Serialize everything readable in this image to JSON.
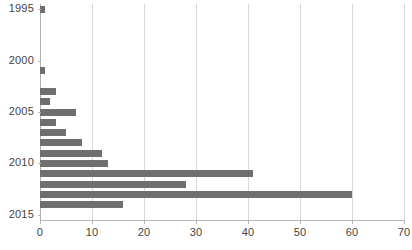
{
  "chart_data": {
    "type": "bar",
    "orientation": "horizontal",
    "title": "",
    "subtitle": "",
    "xlabel": "",
    "ylabel": "",
    "xlim": [
      0,
      70
    ],
    "ylim_categories": [
      "1995",
      "2015"
    ],
    "grid": true,
    "legend": null,
    "legend_position": "none",
    "bar_color": "#6f6f6f",
    "gridline_color": "#d9d9d9",
    "axis_color": "#b9b9b9",
    "text_color": "#444444",
    "xticks": [
      0,
      10,
      20,
      30,
      40,
      50,
      60,
      70
    ],
    "xtick_labels": [
      "0",
      "10",
      "20",
      "30",
      "40",
      "50",
      "60",
      "70"
    ],
    "yticks": [
      1995,
      2000,
      2005,
      2010,
      2015
    ],
    "ytick_labels": [
      "1995",
      "2000",
      "2005",
      "2010",
      "2015"
    ],
    "categories": [
      "1995",
      "1996",
      "1997",
      "1998",
      "1999",
      "2000",
      "2001",
      "2002",
      "2003",
      "2004",
      "2005",
      "2006",
      "2007",
      "2008",
      "2009",
      "2010",
      "2011",
      "2012",
      "2013",
      "2014",
      "2015"
    ],
    "values": [
      1,
      0,
      0,
      0,
      0,
      0,
      1,
      0,
      3,
      2,
      7,
      3,
      5,
      8,
      12,
      13,
      41,
      28,
      60,
      16,
      0
    ],
    "bars": [
      {
        "category": "1995",
        "value": 1
      },
      {
        "category": "1996",
        "value": 0
      },
      {
        "category": "1997",
        "value": 0
      },
      {
        "category": "1998",
        "value": 0
      },
      {
        "category": "1999",
        "value": 0
      },
      {
        "category": "2000",
        "value": 0
      },
      {
        "category": "2001",
        "value": 1
      },
      {
        "category": "2002",
        "value": 0
      },
      {
        "category": "2003",
        "value": 3
      },
      {
        "category": "2004",
        "value": 2
      },
      {
        "category": "2005",
        "value": 7
      },
      {
        "category": "2006",
        "value": 3
      },
      {
        "category": "2007",
        "value": 5
      },
      {
        "category": "2008",
        "value": 8
      },
      {
        "category": "2009",
        "value": 12
      },
      {
        "category": "2010",
        "value": 13
      },
      {
        "category": "2011",
        "value": 41
      },
      {
        "category": "2012",
        "value": 28
      },
      {
        "category": "2013",
        "value": 60
      },
      {
        "category": "2014",
        "value": 16
      },
      {
        "category": "2015",
        "value": 0
      }
    ]
  }
}
